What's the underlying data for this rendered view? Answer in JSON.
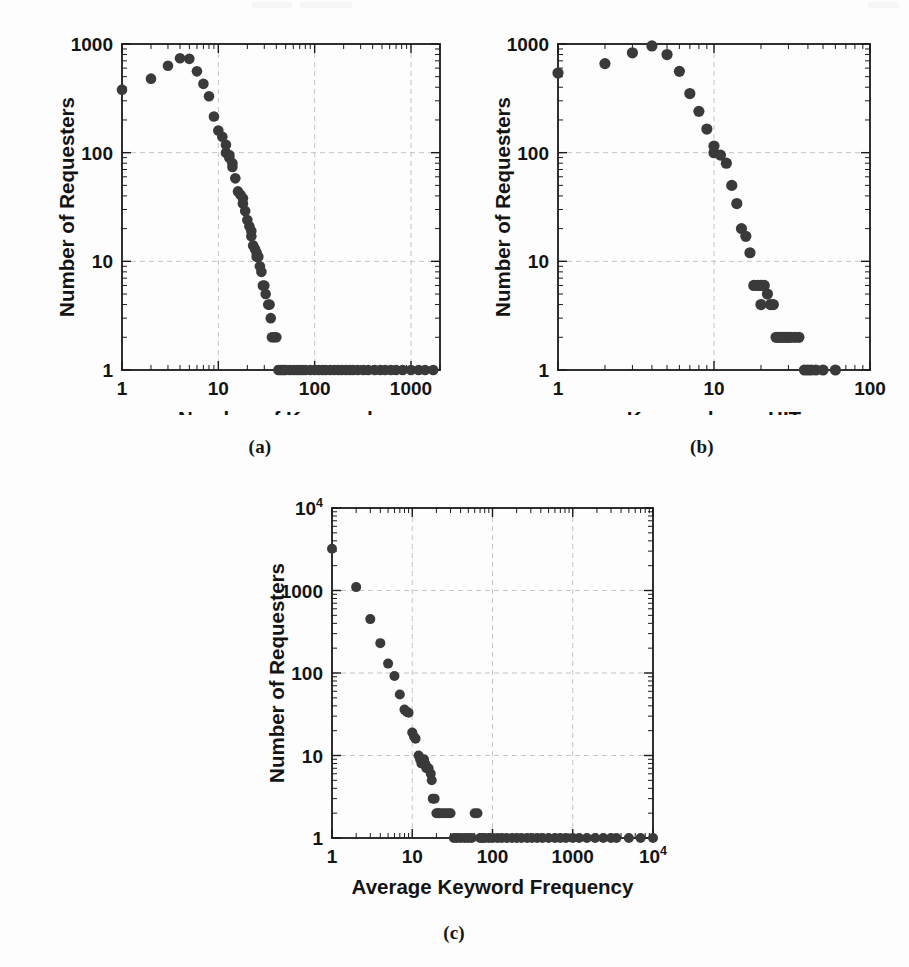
{
  "figure": {
    "background_color": "#fdfdfd",
    "marker_color": "#3a3a3a",
    "frame_color": "#1a1a1a",
    "grid_color": "#bdbdbd",
    "panels": [
      {
        "key": "a",
        "caption": "(a)"
      },
      {
        "key": "b",
        "caption": "(b)"
      },
      {
        "key": "c",
        "caption": "(c)"
      }
    ]
  },
  "chart_data": [
    {
      "id": "panel-a",
      "type": "scatter",
      "panel_label": "(a)",
      "title": "",
      "xlabel": "Number of Keywords",
      "ylabel": "Number of Requesters",
      "xscale": "log",
      "yscale": "log",
      "xlim": [
        1,
        2000
      ],
      "ylim": [
        1,
        1000
      ],
      "xticks": [
        1,
        10,
        100,
        1000
      ],
      "xticklabels": [
        "1",
        "10",
        "100",
        "1000"
      ],
      "yticks": [
        1,
        10,
        100,
        1000
      ],
      "yticklabels": [
        "1",
        "10",
        "100",
        "1000"
      ],
      "grid": true,
      "legend": "none",
      "x": [
        1,
        2,
        3,
        4,
        5,
        6,
        7,
        8,
        9,
        10,
        11,
        12,
        12,
        13,
        13,
        14,
        14,
        15,
        16,
        17,
        18,
        18,
        19,
        20,
        21,
        22,
        22,
        23,
        24,
        25,
        25,
        26,
        27,
        28,
        29,
        30,
        31,
        33,
        34,
        35,
        36,
        38,
        40,
        42,
        44,
        46,
        48,
        50,
        55,
        60,
        65,
        70,
        75,
        80,
        90,
        100,
        110,
        120,
        130,
        145,
        160,
        175,
        190,
        210,
        230,
        250,
        280,
        320,
        360,
        420,
        480,
        540,
        620,
        700,
        820,
        1000,
        1200,
        1400,
        1700
      ],
      "y": [
        380,
        480,
        630,
        740,
        730,
        560,
        430,
        330,
        215,
        160,
        140,
        118,
        100,
        95,
        90,
        80,
        74,
        58,
        44,
        41,
        38,
        34,
        29,
        24,
        21,
        19,
        17,
        14,
        13,
        12,
        11,
        11,
        9,
        8,
        6,
        6,
        5,
        4,
        4,
        3,
        2,
        2,
        2,
        1,
        1,
        1,
        1,
        1,
        1,
        1,
        1,
        1,
        1,
        1,
        1,
        1,
        1,
        1,
        1,
        1,
        1,
        1,
        1,
        1,
        1,
        1,
        1,
        1,
        1,
        1,
        1,
        1,
        1,
        1,
        1,
        1,
        1,
        1,
        1
      ]
    },
    {
      "id": "panel-b",
      "type": "scatter",
      "panel_label": "(b)",
      "title": "",
      "xlabel": "Keywords per HIT",
      "ylabel": "Number of Requesters",
      "xscale": "log",
      "yscale": "log",
      "xlim": [
        1,
        100
      ],
      "ylim": [
        1,
        1000
      ],
      "xticks": [
        1,
        10,
        100
      ],
      "xticklabels": [
        "1",
        "10",
        "100"
      ],
      "yticks": [
        1,
        10,
        100,
        1000
      ],
      "yticklabels": [
        "1",
        "10",
        "100",
        "1000"
      ],
      "grid": true,
      "legend": "none",
      "x": [
        1,
        2,
        3,
        4,
        5,
        6,
        7,
        8,
        9,
        10,
        10,
        11,
        12,
        13,
        14,
        15,
        16,
        17,
        18,
        19,
        20,
        20,
        21,
        22,
        23,
        24,
        25,
        26,
        27,
        28,
        29,
        30,
        31,
        33,
        35,
        38,
        40,
        42,
        45,
        50,
        60
      ],
      "y": [
        540,
        660,
        830,
        960,
        800,
        560,
        350,
        240,
        165,
        115,
        100,
        95,
        80,
        50,
        34,
        20,
        17,
        12,
        6,
        6,
        6,
        4,
        6,
        5,
        4,
        4,
        2,
        2,
        2,
        2,
        2,
        2,
        2,
        2,
        2,
        1,
        1,
        1,
        1,
        1,
        1
      ]
    },
    {
      "id": "panel-c",
      "type": "scatter",
      "panel_label": "(c)",
      "title": "",
      "xlabel": "Average Keyword Frequency",
      "ylabel": "Number of Requesters",
      "xscale": "log",
      "yscale": "log",
      "xlim": [
        1,
        10000
      ],
      "ylim": [
        1,
        10000
      ],
      "xticks": [
        1,
        10,
        100,
        1000,
        10000
      ],
      "xticklabels": [
        "1",
        "10",
        "100",
        "1000",
        "10⁴"
      ],
      "yticks": [
        1,
        10,
        100,
        1000,
        10000
      ],
      "yticklabels": [
        "1",
        "10",
        "100",
        "1000",
        "10⁴"
      ],
      "grid": true,
      "legend": "none",
      "x": [
        1,
        2,
        3,
        4,
        5,
        6,
        7,
        8,
        8.5,
        9,
        10,
        10.5,
        11,
        12,
        12.5,
        13,
        14,
        14.5,
        15,
        16,
        17,
        17.5,
        18,
        19,
        20,
        21,
        22,
        24,
        26,
        28,
        30,
        33,
        36,
        40,
        45,
        50,
        55,
        60,
        65,
        70,
        75,
        80,
        90,
        100,
        115,
        130,
        150,
        175,
        200,
        230,
        270,
        310,
        360,
        420,
        500,
        600,
        700,
        820,
        1000,
        1200,
        1500,
        1900,
        2400,
        3000,
        3500,
        5000,
        7000,
        10000
      ],
      "y": [
        3200,
        1100,
        450,
        230,
        130,
        92,
        55,
        36,
        34,
        33,
        19,
        17,
        16,
        10,
        9,
        8,
        9,
        8,
        7,
        7,
        6,
        5,
        3,
        3,
        2,
        2,
        2,
        2,
        2,
        2,
        2,
        1,
        1,
        1,
        1,
        1,
        1,
        2,
        2,
        1,
        1,
        1,
        1,
        1,
        1,
        1,
        1,
        1,
        1,
        1,
        1,
        1,
        1,
        1,
        1,
        1,
        1,
        1,
        1,
        1,
        1,
        1,
        1,
        1,
        1,
        1,
        1,
        1
      ]
    }
  ]
}
